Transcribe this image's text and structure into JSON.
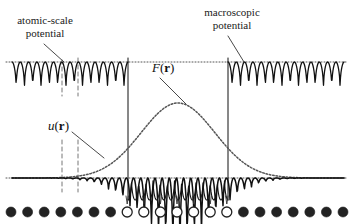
{
  "figure": {
    "title_alt": "Atomic-scale and macroscopic potential with envelope function",
    "background": "#ffffff",
    "ink": "#111111",
    "dotted_color": "#555555",
    "dashed_color": "#777777"
  },
  "labels": {
    "atomic_scale_line1": "atomic-scale",
    "atomic_scale_line2": "potential",
    "macroscopic_line1": "macroscopic",
    "macroscopic_line2": "potential",
    "envelope_symbol_italic": "F",
    "envelope_symbol_open": "(",
    "envelope_symbol_bold": "r",
    "envelope_symbol_close": ")",
    "local_symbol_italic": "u",
    "local_symbol_open": "(",
    "local_symbol_bold": "r",
    "local_symbol_close": ")"
  },
  "chart_data": {
    "type": "line",
    "title": "",
    "xlabel": "",
    "ylabel": "",
    "grid": false,
    "legend": "none",
    "xlim": [
      0,
      354
    ],
    "ylim": [
      0,
      224
    ],
    "panels": [
      {
        "name": "upper-left-atomic-potential",
        "description": "Periodic cusped potential wells at constant amplitude, left of defect region",
        "x_start": 12,
        "x_end": 128,
        "baseline_y": 62,
        "amplitude": 28,
        "period": 16.6,
        "wells": 7
      },
      {
        "name": "upper-right-atomic-potential",
        "description": "Periodic cusped potential wells at constant amplitude, right of defect region",
        "x_start": 228,
        "x_end": 344,
        "baseline_y": 62,
        "amplitude": 28,
        "period": 16.6,
        "wells": 7
      },
      {
        "name": "central-modulated-potential",
        "description": "Large amplitude oscillations in the defect region bounded by the envelope F(r)",
        "x_start": 128,
        "x_end": 228,
        "baseline_y": 178,
        "peak_y": 103,
        "period": 14.3,
        "wells": 7
      },
      {
        "name": "lower-central-extension",
        "description": "Downward periodic wells below the baseline inside the defect region",
        "x_start": 128,
        "x_end": 228,
        "baseline_y": 178,
        "amplitude": 22,
        "period": 14.3,
        "wells": 7
      },
      {
        "name": "modulated-wave-u",
        "description": "Oscillating function u(r) whose amplitude follows the Gaussian envelope",
        "x_start": 12,
        "x_end": 344,
        "baseline_y": 178,
        "period": 14.3
      }
    ],
    "envelope": {
      "name": "F(r)",
      "description": "Dotted Gaussian envelope peaking at the centre of the defect region",
      "center_x": 178,
      "baseline_y": 178,
      "peak_y": 103,
      "sigma": 52
    },
    "reference_lines": [
      {
        "name": "upper-dotted-baseline",
        "orientation": "horizontal",
        "y": 62,
        "x_start": 6,
        "x_end": 348,
        "style": "dotted"
      },
      {
        "name": "lower-dotted-baseline",
        "orientation": "horizontal",
        "y": 178,
        "x_start": 6,
        "x_end": 348,
        "style": "dotted"
      },
      {
        "name": "left-defect-boundary",
        "orientation": "vertical",
        "x": 128,
        "y_start": 58,
        "y_end": 200,
        "style": "solid"
      },
      {
        "name": "right-defect-boundary",
        "orientation": "vertical",
        "x": 228,
        "y_start": 58,
        "y_end": 200,
        "style": "solid"
      },
      {
        "name": "atomic-marker-a",
        "orientation": "vertical",
        "x": 62,
        "y_start": 60,
        "y_end": 96,
        "style": "dashed"
      },
      {
        "name": "atomic-marker-b",
        "orientation": "vertical",
        "x": 78,
        "y_start": 58,
        "y_end": 96,
        "style": "dashed"
      },
      {
        "name": "atomic-marker-c",
        "orientation": "vertical",
        "x": 62,
        "y_start": 140,
        "y_end": 192,
        "style": "dashed"
      },
      {
        "name": "atomic-marker-d",
        "orientation": "vertical",
        "x": 78,
        "y_start": 140,
        "y_end": 192,
        "style": "dashed"
      }
    ],
    "leader_lines": [
      {
        "name": "atomic-scale-leader",
        "from_x": 44,
        "from_y": 44,
        "to_x": 64,
        "to_y": 62
      },
      {
        "name": "macroscopic-leader",
        "from_x": 228,
        "from_y": 36,
        "to_x": 244,
        "to_y": 62
      },
      {
        "name": "envelope-leader",
        "from_x": 160,
        "from_y": 78,
        "to_x": 186,
        "to_y": 104
      },
      {
        "name": "local-leader",
        "from_x": 72,
        "from_y": 132,
        "to_x": 104,
        "to_y": 158
      }
    ],
    "atom_row": {
      "name": "atomic-chain",
      "y": 212,
      "radius": 5,
      "spacing": 16.6,
      "count": 21,
      "filled_color": "#222222",
      "open_color": "#ffffff",
      "pattern": [
        "filled",
        "filled",
        "filled",
        "filled",
        "filled",
        "filled",
        "filled",
        "open",
        "open",
        "open",
        "open",
        "open",
        "open",
        "open",
        "filled",
        "filled",
        "filled",
        "filled",
        "filled",
        "filled",
        "filled"
      ],
      "tick_marks": {
        "name": "defect-atom-ticks",
        "count": 7,
        "y_top": 196,
        "y_bottom": 204
      }
    }
  }
}
